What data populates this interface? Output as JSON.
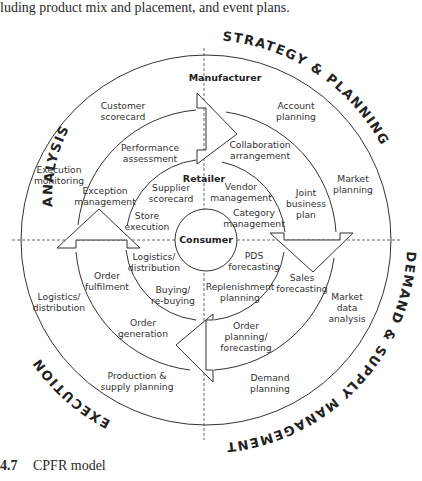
{
  "page": {
    "intro_text": "luding product mix and placement, and event plans.",
    "caption_number": "4.7",
    "caption_title": "CPFR model"
  },
  "diagram": {
    "quadrants": {
      "top_left": "ANALYSIS",
      "top_right": "STRATEGY & PLANNING",
      "bottom_right": "DEMAND & SUPPLY MANAGEMENT",
      "bottom_left": "EXECUTION"
    },
    "roles": {
      "outer": "Manufacturer",
      "middle": "Retailer",
      "center": "Consumer"
    },
    "outer_ring": {
      "customer_scorecard": [
        "Customer",
        "scorecard"
      ],
      "account_planning": [
        "Account",
        "planning"
      ],
      "execution_monitoring": [
        "Execution",
        "monitoring"
      ],
      "market_planning": [
        "Market",
        "planning"
      ],
      "logistics_distribution": [
        "Logistics/",
        "distribution"
      ],
      "market_data_analysis": [
        "Market",
        "data",
        "analysis"
      ],
      "production_supply_planning": [
        "Production &",
        "supply planning"
      ],
      "demand_planning": [
        "Demand",
        "planning"
      ]
    },
    "middle_ring": {
      "performance_assessment": [
        "Performance",
        "assessment"
      ],
      "collaboration_arrangement": [
        "Collaboration",
        "arrangement"
      ],
      "exception_management": [
        "Exception",
        "management"
      ],
      "joint_business_plan": [
        "Joint",
        "business",
        "plan"
      ],
      "order_fulfilment": [
        "Order",
        "fulfilment"
      ],
      "sales_forecasting": [
        "Sales",
        "forecasting"
      ],
      "order_generation": [
        "Order",
        "generation"
      ],
      "order_planning_forecasting": [
        "Order",
        "planning/",
        "forecasting"
      ]
    },
    "inner_ring": {
      "supplier_scorecard": [
        "Supplier",
        "scorecard"
      ],
      "vendor_management": [
        "Vendor",
        "management"
      ],
      "store_execution": [
        "Store",
        "execution"
      ],
      "category_management": [
        "Category",
        "management"
      ],
      "logistics_distribution": [
        "Logistics/",
        "distribution"
      ],
      "pds_forecasting": [
        "PDS",
        "forecasting"
      ],
      "buying_rebuying": [
        "Buying/",
        "re-buying"
      ],
      "replenishment_planning": [
        "Replenishment",
        "planning"
      ]
    },
    "colors": {
      "line": "#333333",
      "text": "#333333",
      "background": "#ffffff"
    }
  }
}
